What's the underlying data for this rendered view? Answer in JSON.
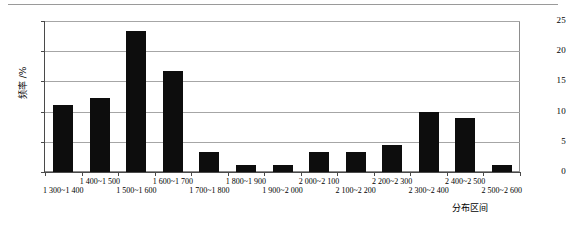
{
  "chart_data": {
    "type": "bar",
    "title": "",
    "subtitle": "",
    "xlabel": "分布区间",
    "ylabel": "频率 /%",
    "ylim": [
      0,
      25
    ],
    "yticks": [
      0,
      5,
      10,
      15,
      20,
      25
    ],
    "grid": true,
    "legend": null,
    "categories": [
      "1 300~1 400",
      "1 400~1 500",
      "1 500~1 600",
      "1 600~1 700",
      "1 700~1 800",
      "1 800~1 900",
      "1 900~2 000",
      "2 000~2 100",
      "2 100~2 200",
      "2 200~2 300",
      "2 300~2 400",
      "2 400~2 500",
      "2 500~2 600"
    ],
    "values": [
      11.1,
      12.2,
      23.3,
      16.7,
      3.3,
      1.1,
      1.1,
      3.3,
      3.3,
      4.4,
      10.0,
      8.9,
      1.1
    ],
    "series": [
      {
        "name": "频率",
        "color": "#0d0d0d",
        "values": [
          11.1,
          12.2,
          23.3,
          16.7,
          3.3,
          1.1,
          1.1,
          3.3,
          3.3,
          4.4,
          10.0,
          8.9,
          1.1
        ]
      }
    ]
  },
  "axis": {
    "y_tick_labels": [
      "0",
      "5",
      "10",
      "15",
      "20",
      "25"
    ],
    "y_title": "频率 /%",
    "x_title": "分布区间"
  },
  "colors": {
    "bar": "#0d0d0d",
    "grid": "#a6a6a6",
    "axis": "#4a4a4a",
    "rule": "#9a9a9a",
    "background": "#ffffff"
  }
}
